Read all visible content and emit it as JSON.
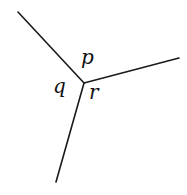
{
  "diagram": {
    "vertex": {
      "x": 84,
      "y": 83
    },
    "segments": [
      {
        "id": "upper-left",
        "x1": 18,
        "y1": 12,
        "x2": 84,
        "y2": 83
      },
      {
        "id": "right",
        "x1": 84,
        "y1": 83,
        "x2": 179,
        "y2": 58
      },
      {
        "id": "lower",
        "x1": 84,
        "y1": 83,
        "x2": 56,
        "y2": 182
      }
    ],
    "labels": {
      "p": {
        "text": "p",
        "x": 81,
        "y": 64
      },
      "q": {
        "text": "q",
        "x": 53,
        "y": 93
      },
      "r": {
        "text": "r",
        "x": 89,
        "y": 99
      }
    },
    "colors": {
      "line": "#1a1a1a",
      "text": "#111111",
      "background": "#ffffff"
    }
  }
}
